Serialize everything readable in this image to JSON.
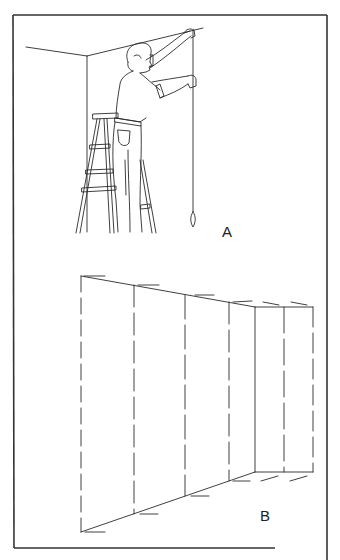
{
  "figure": {
    "panels": [
      {
        "id": "A",
        "label": "A",
        "description": "Man on stepladder holding a plumb line against the wall below the ceiling line"
      },
      {
        "id": "B",
        "label": "B",
        "description": "Wall in perspective with plumb-marked vertical guidelines for paper strips"
      }
    ]
  },
  "colors": {
    "ink": "#2a2a2a",
    "frame": "#333333",
    "background": "#ffffff"
  }
}
